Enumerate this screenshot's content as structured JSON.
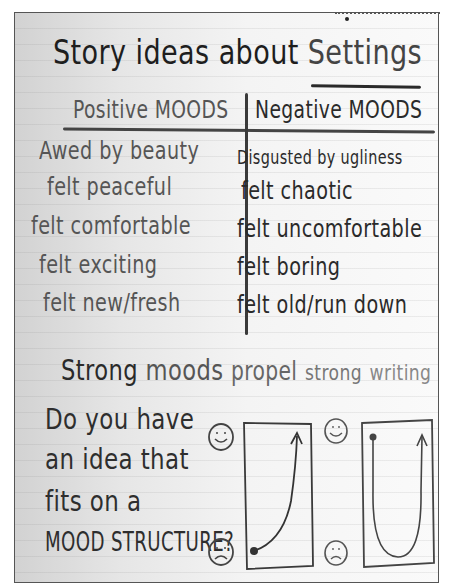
{
  "chart": {
    "title_prefix": "Story ideas about ",
    "title_emphasis": "Settings",
    "columns": {
      "positive": {
        "header": "Positive MOODS",
        "items": [
          "Awed by beauty",
          "felt peaceful",
          "felt comfortable",
          "felt exciting",
          "felt new/fresh"
        ]
      },
      "negative": {
        "header": "Negative MOODS",
        "items": [
          "Disgusted by ugliness",
          "felt chaotic",
          "felt uncomfortable",
          "felt boring",
          "felt old/run down"
        ]
      }
    },
    "tagline": {
      "w1": "Strong",
      "w2": "moods",
      "w3": "propel",
      "w4": "strong",
      "w5": "writing"
    },
    "question": {
      "lines": [
        "Do you have",
        "an idea that",
        "fits on a",
        "MOOD STRUCTURE?"
      ]
    },
    "diagrams": [
      {
        "name": "rising-mood",
        "top_face": "happy-face",
        "bottom_face": "sad-face",
        "path": "starts low (sad), curves upward to high (happy)"
      },
      {
        "name": "u-shaped-mood",
        "top_face": "happy-face",
        "bottom_face": "sad-face",
        "path": "starts high (happy), drops to low (sad), rises back to high (happy)"
      }
    ],
    "colors": {
      "ink_dark": "#2a2a2a",
      "ink_gray": "#555555",
      "paper": "#f4f4f4",
      "rule": "#444444"
    }
  }
}
